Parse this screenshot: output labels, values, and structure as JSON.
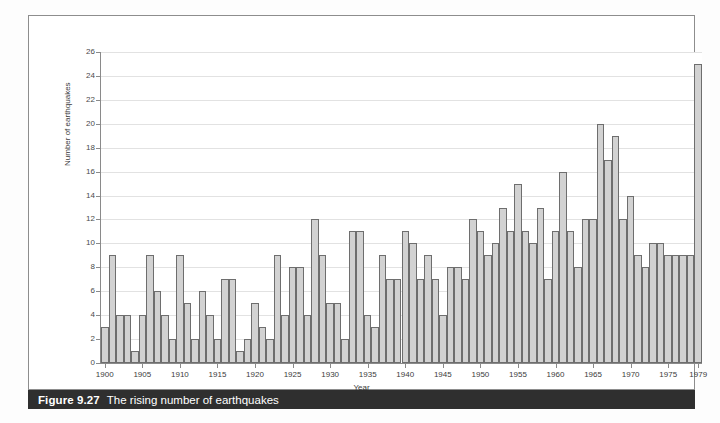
{
  "caption": {
    "number": "Figure 9.27",
    "text": "The rising number of earthquakes"
  },
  "chart_data": {
    "type": "bar",
    "title": "The rising number of earthquakes",
    "xlabel": "Year",
    "ylabel": "Number of earthquakes",
    "ylim": [
      0,
      26
    ],
    "xlim": [
      1900,
      1979
    ],
    "grid": true,
    "legend": "none",
    "y_ticks": [
      0,
      2,
      4,
      6,
      8,
      10,
      12,
      14,
      16,
      18,
      20,
      22,
      24,
      26
    ],
    "x_ticks": [
      1900,
      1905,
      1910,
      1915,
      1920,
      1925,
      1930,
      1935,
      1940,
      1945,
      1950,
      1955,
      1960,
      1965,
      1970,
      1975,
      1979
    ],
    "categories": [
      1900,
      1901,
      1902,
      1903,
      1904,
      1905,
      1906,
      1907,
      1908,
      1909,
      1910,
      1911,
      1912,
      1913,
      1914,
      1915,
      1916,
      1917,
      1918,
      1919,
      1920,
      1921,
      1922,
      1923,
      1924,
      1925,
      1926,
      1927,
      1928,
      1929,
      1930,
      1931,
      1932,
      1933,
      1934,
      1935,
      1936,
      1937,
      1938,
      1939,
      1940,
      1941,
      1942,
      1943,
      1944,
      1945,
      1946,
      1947,
      1948,
      1949,
      1950,
      1951,
      1952,
      1953,
      1954,
      1955,
      1956,
      1957,
      1958,
      1959,
      1960,
      1961,
      1962,
      1963,
      1964,
      1965,
      1966,
      1967,
      1968,
      1969,
      1970,
      1971,
      1972,
      1973,
      1974,
      1975,
      1976,
      1977,
      1978,
      1979
    ],
    "values": [
      3,
      9,
      4,
      4,
      1,
      4,
      9,
      6,
      4,
      2,
      9,
      5,
      2,
      6,
      4,
      2,
      7,
      7,
      1,
      2,
      5,
      3,
      2,
      9,
      4,
      8,
      8,
      4,
      12,
      9,
      5,
      5,
      2,
      11,
      11,
      4,
      3,
      9,
      7,
      7,
      11,
      10,
      7,
      9,
      7,
      4,
      8,
      8,
      7,
      12,
      11,
      9,
      10,
      13,
      11,
      15,
      11,
      10,
      13,
      7,
      11,
      16,
      11,
      8,
      12,
      12,
      20,
      17,
      19,
      12,
      14,
      9,
      8,
      10,
      10,
      9,
      9,
      9,
      9,
      25
    ]
  },
  "axis": {
    "y_title": "Number of earthquakes",
    "x_title": "Year"
  }
}
